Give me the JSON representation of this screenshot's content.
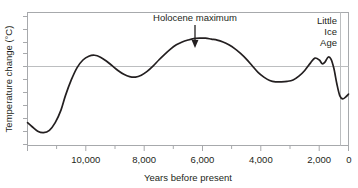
{
  "chart_data": {
    "type": "line",
    "title": "",
    "xlabel": "Years before present",
    "ylabel": "Temperature change (°C)",
    "xlim": [
      11000,
      0
    ],
    "xticks": [
      10000,
      8000,
      6000,
      4000,
      2000,
      0
    ],
    "xticklabels": [
      "10,000",
      "8,000",
      "6,000",
      "4,000",
      "2,000",
      "0"
    ],
    "x_minor_ticks": [
      11000,
      9000,
      7000,
      5000,
      3000,
      1000
    ],
    "ylim": [
      -1.6,
      1.2
    ],
    "yticks": [],
    "yticklabels": [],
    "y_minor_tick_count": 10,
    "grid": false,
    "reference_line_y": 0,
    "legend": null,
    "series": [
      {
        "name": "Temperature change",
        "x": [
          11000,
          10850,
          10650,
          10450,
          10250,
          10050,
          9850,
          9700,
          9500,
          9300,
          9100,
          8900,
          8700,
          8500,
          8300,
          8100,
          7900,
          7700,
          7500,
          7300,
          7100,
          6900,
          6700,
          6500,
          6300,
          6100,
          5900,
          5700,
          5500,
          5300,
          5100,
          4900,
          4700,
          4500,
          4300,
          4100,
          3900,
          3700,
          3500,
          3300,
          3100,
          2900,
          2700,
          2500,
          2300,
          2100,
          1900,
          1700,
          1500,
          1300,
          1150,
          1000,
          900,
          800,
          700,
          600,
          500,
          400,
          300,
          200,
          100,
          0
        ],
        "y": [
          -1.12,
          -1.2,
          -1.3,
          -1.33,
          -1.28,
          -1.12,
          -0.85,
          -0.55,
          -0.22,
          0.04,
          0.2,
          0.28,
          0.3,
          0.26,
          0.18,
          0.08,
          -0.02,
          -0.1,
          -0.15,
          -0.16,
          -0.12,
          -0.04,
          0.07,
          0.2,
          0.32,
          0.43,
          0.52,
          0.58,
          0.62,
          0.65,
          0.66,
          0.66,
          0.64,
          0.62,
          0.58,
          0.52,
          0.44,
          0.34,
          0.22,
          0.08,
          -0.06,
          -0.16,
          -0.23,
          -0.26,
          -0.26,
          -0.25,
          -0.22,
          -0.14,
          -0.02,
          0.14,
          0.24,
          0.2,
          0.12,
          0.16,
          0.26,
          0.22,
          0.02,
          -0.3,
          -0.55,
          -0.62,
          -0.58,
          -0.52
        ]
      }
    ],
    "annotations": [
      {
        "id": "holocene-maximum",
        "text": "Holocene maximum",
        "x": 6200,
        "arrow": "down"
      },
      {
        "id": "little-ice-age",
        "lines": [
          "Little",
          "Ice",
          "Age"
        ],
        "x": 400,
        "marker_line_x": 300
      }
    ],
    "colors": {
      "curve": "#231f20",
      "axis": "#a7a9ac",
      "reference_line": "#bcbec0",
      "text": "#231f20",
      "background": "#ffffff"
    }
  },
  "axes": {
    "x_label": "Years before present",
    "y_label": "Temperature change (°C)",
    "x_tick_labels": [
      "10,000",
      "8,000",
      "6,000",
      "4,000",
      "2,000",
      "0"
    ]
  },
  "annotations": {
    "holocene_maximum": "Holocene maximum",
    "little_ice_age_line1": "Little",
    "little_ice_age_line2": "Ice",
    "little_ice_age_line3": "Age"
  }
}
